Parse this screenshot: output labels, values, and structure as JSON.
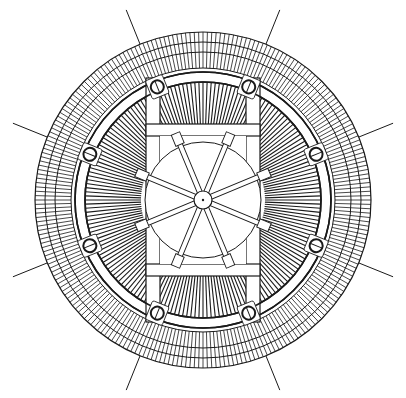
{
  "diagram": {
    "title": "",
    "canvas": {
      "width": 406,
      "height": 398,
      "background": "#ffffff"
    },
    "stroke_color": "#1a1a1a",
    "center": [
      203,
      200
    ],
    "outer_fringe": {
      "r_outer": 168,
      "r_mid1": 158,
      "r_mid2": 148,
      "r_inner": 132,
      "tick_count": 240
    },
    "band_ring": {
      "r_outer": 128,
      "r_inner": 118
    },
    "inner_fringe": {
      "r_outer": 118,
      "r_inner": 62,
      "tick_count": 180
    },
    "frame": {
      "vertical_bars": [
        {
          "x": 146,
          "w": 14,
          "y1": 78,
          "y2": 322
        },
        {
          "x": 246,
          "w": 14,
          "y1": 78,
          "y2": 322
        }
      ],
      "horizontal_bars": [
        {
          "y": 124,
          "h": 12,
          "x1": 146,
          "x2": 260
        },
        {
          "y": 264,
          "h": 12,
          "x1": 146,
          "x2": 260
        }
      ]
    },
    "hub": {
      "inner_circle_r": 58,
      "hub_r": 9,
      "spoke_count": 8,
      "spoke_len": 70
    },
    "bolts": {
      "radius": 122,
      "bolt_r": 6.5,
      "angles_deg": [
        -112,
        -68,
        -22,
        22,
        68,
        112,
        158,
        202
      ],
      "leader_line_r_end": 205
    }
  }
}
